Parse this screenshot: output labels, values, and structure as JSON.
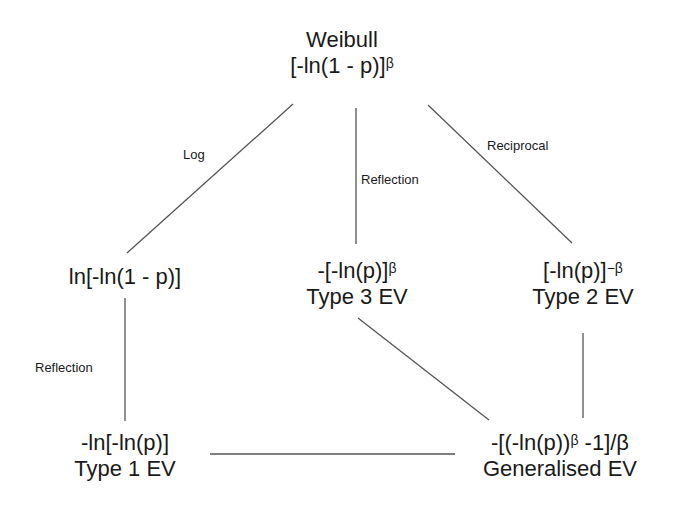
{
  "nodes": {
    "weibull": {
      "title": "Weibull",
      "formula_base": "[-ln(1 - p)]",
      "formula_sup": "β"
    },
    "log_weibull": {
      "formula": "ln[-ln(1 - p)]"
    },
    "type3": {
      "formula_base": "-[-ln(p)]",
      "formula_sup": "β",
      "title": "Type 3 EV"
    },
    "type2": {
      "formula_base": "[-ln(p)]",
      "formula_sup": "−β",
      "title": "Type 2 EV"
    },
    "type1": {
      "formula": "-ln[-ln(p)]",
      "title": "Type 1 EV"
    },
    "generalised": {
      "formula_pre": "-[(-ln(p))",
      "formula_sup": "β",
      "formula_post": " -1]/β",
      "title": "Generalised EV"
    }
  },
  "edge_labels": {
    "log": "Log",
    "reflection_top": "Reflection",
    "reciprocal": "Reciprocal",
    "reflection_left": "Reflection"
  },
  "colors": {
    "line": "#555555",
    "text": "#1a1a1a"
  }
}
